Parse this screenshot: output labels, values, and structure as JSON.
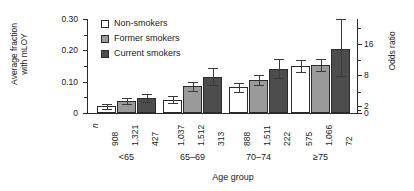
{
  "chart_data": {
    "type": "bar",
    "title": "",
    "xlabel": "Age group",
    "ylabel": "Average fraction\nwith mLOY",
    "ylabel_right": "Odds ratio",
    "categories": [
      "<65",
      "65–69",
      "70–74",
      "≥75"
    ],
    "series": [
      {
        "name": "Non-smokers",
        "color": "#ffffff",
        "values": [
          0.022,
          0.042,
          0.082,
          0.15
        ],
        "err_low": [
          0.014,
          0.032,
          0.068,
          0.132
        ],
        "err_high": [
          0.03,
          0.053,
          0.097,
          0.168
        ],
        "n": [
          "908",
          "1,037",
          "888",
          "575"
        ]
      },
      {
        "name": "Former smokers",
        "color": "#9a9a9a",
        "values": [
          0.038,
          0.085,
          0.105,
          0.152
        ],
        "err_low": [
          0.029,
          0.071,
          0.09,
          0.133
        ],
        "err_high": [
          0.048,
          0.1,
          0.121,
          0.171
        ],
        "n": [
          "1,321",
          "1,512",
          "1,511",
          "1,066"
        ]
      },
      {
        "name": "Current smokers",
        "color": "#4d4d4d",
        "values": [
          0.048,
          0.115,
          0.14,
          0.205
        ],
        "err_low": [
          0.034,
          0.089,
          0.112,
          0.118
        ],
        "err_high": [
          0.062,
          0.143,
          0.172,
          0.3
        ],
        "n": [
          "427",
          "313",
          "222",
          "72"
        ]
      }
    ],
    "ylim": [
      0,
      0.3
    ],
    "yticks_major": [
      0,
      0.1,
      0.2,
      0.3
    ],
    "ytick_labels": [
      "0",
      "0.10",
      "0.20",
      "0.30"
    ],
    "yticks_minor": [
      0.05,
      0.15,
      0.25
    ],
    "right_axis": {
      "label": "Odds ratio",
      "ticks": [
        0,
        2,
        16
      ],
      "tick_labels": [
        "0",
        "2",
        "8",
        "16"
      ],
      "labeled": [
        {
          "value": "0",
          "frac": 0.0
        },
        {
          "value": "2",
          "frac": 0.073
        },
        {
          "value": "8",
          "frac": 0.4
        },
        {
          "value": "16",
          "frac": 0.73
        }
      ],
      "minor_fracs": [
        0.037,
        0.22,
        0.565,
        0.9
      ]
    },
    "grid": false,
    "legend_position": "top-left",
    "n_marker": "n"
  },
  "legend": {
    "items": [
      {
        "label": "Non-smokers",
        "color": "#ffffff"
      },
      {
        "label": "Former smokers",
        "color": "#9a9a9a"
      },
      {
        "label": "Current smokers",
        "color": "#4d4d4d"
      }
    ]
  },
  "axes": {
    "x_title": "Age group",
    "y_title_left": "Average fraction\nwith mLOY",
    "y_title_right": "Odds ratio"
  }
}
